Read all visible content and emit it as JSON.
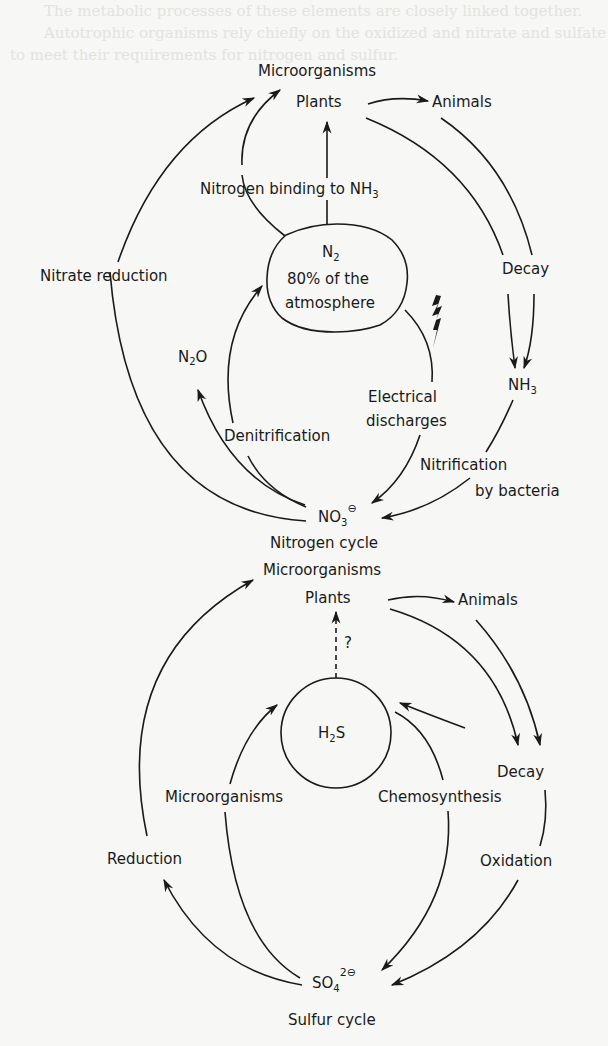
{
  "background": {
    "paper_color": "#f7f7f5",
    "ink_color": "#1a1a1a",
    "bleed_color": "#e3e3e0"
  },
  "bleed_text": [
    "The metabolic processes of these elements are closely linked together.",
    "Autotrophic organisms rely chiefly on the oxidized and nitrate and sulfate to meet their requirements for nitrogen and sulfur."
  ],
  "nitrogen_cycle": {
    "title": "Nitrogen cycle",
    "nodes": {
      "microorganisms": "Microorganisms",
      "plants": "Plants",
      "animals": "Animals",
      "n2": "N",
      "n2_sub": "2",
      "n2_line1": "80% of the",
      "n2_line2": "atmosphere",
      "n2o_n": "N",
      "n2o_sub": "2",
      "n2o_o": "O",
      "nh3": "NH",
      "nh3_sub": "3",
      "no3": "NO",
      "no3_sub": "3",
      "no3_charge": "⊖",
      "decay": "Decay"
    },
    "processes": {
      "nitrogen_binding": "Nitrogen binding to NH",
      "nitrogen_binding_sub": "3",
      "nitrate_reduction": "Nitrate reduction",
      "denitrification": "Denitrification",
      "electrical_1": "Electrical",
      "electrical_2": "discharges",
      "nitrification_1": "Nitrification",
      "nitrification_2": "by bacteria"
    }
  },
  "sulfur_cycle": {
    "title": "Sulfur cycle",
    "nodes": {
      "microorganisms_top": "Microorganisms",
      "plants": "Plants",
      "question": "?",
      "animals": "Animals",
      "h2s_h": "H",
      "h2s_sub": "2",
      "h2s_s": "S",
      "decay": "Decay",
      "so4": "SO",
      "so4_sub": "4",
      "so4_charge": "2⊖"
    },
    "processes": {
      "microorganisms_bottom": "Microorganisms",
      "chemosynthesis": "Chemosynthesis",
      "reduction": "Reduction",
      "oxidation": "Oxidation"
    }
  }
}
